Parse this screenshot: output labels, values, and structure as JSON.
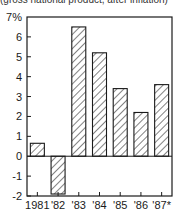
{
  "chart_data": {
    "type": "bar",
    "title": "(gross national product, after inflation)",
    "xlabel": "",
    "ylabel": "",
    "y_unit": "%",
    "categories": [
      "1981",
      "'82",
      "'83",
      "'84",
      "'85",
      "'86",
      "'87*"
    ],
    "values": [
      0.65,
      -1.9,
      6.5,
      5.2,
      3.4,
      2.2,
      3.6
    ],
    "ylim": [
      -2,
      7
    ],
    "y_ticks": [
      -2,
      -1,
      0,
      1,
      2,
      3,
      4,
      5,
      6,
      7
    ],
    "y_tick_labels": [
      "-2",
      "-1",
      "0",
      "1",
      "2",
      "3",
      "4",
      "5",
      "6",
      "7%"
    ],
    "grid": false,
    "legend": "none",
    "bar_fill": "diagonal-hatch",
    "colors": {
      "stroke": "#1a1a1a",
      "background": "#ffffff"
    }
  }
}
